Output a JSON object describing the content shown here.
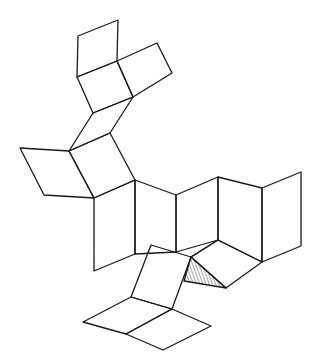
{
  "diagram": {
    "type": "polyhedron-net",
    "stroke_color": "#1a1a1a",
    "background": "#ffffff",
    "faces": [
      {
        "id": "top-left-square",
        "points": "78,36 118,20 117,61 77,77"
      },
      {
        "id": "top-center-square",
        "points": "77,77 117,61 133,97 93,113"
      },
      {
        "id": "top-right-square",
        "points": "117,61 157,43 172,73 133,97"
      },
      {
        "id": "upper-rhombus",
        "points": "93,113 133,97 110,133 69,151"
      },
      {
        "id": "left-wing-square",
        "points": "69,151 20,148 44,195 94,198"
      },
      {
        "id": "middle-square",
        "points": "69,151 110,133 135,180 94,198"
      },
      {
        "id": "strip-panel-1",
        "points": "94,198 135,180 135,254 94,271"
      },
      {
        "id": "strip-panel-2",
        "points": "135,180 176,195 176,252 135,254"
      },
      {
        "id": "strip-panel-3",
        "points": "176,195 218,177 218,240 176,252"
      },
      {
        "id": "strip-panel-4",
        "points": "218,177 262,188 262,262 218,240"
      },
      {
        "id": "strip-panel-5",
        "points": "262,188 301,172 301,246 262,262"
      },
      {
        "id": "lower-right-quad",
        "points": "191,257 218,240 262,262 226,288"
      },
      {
        "id": "tilted-square",
        "points": "151,245 191,257 172,309 131,297"
      },
      {
        "id": "bottom-left-rhombus",
        "points": "131,297 172,309 126,334 83,322"
      },
      {
        "id": "bottom-right-rhombus",
        "points": "172,309 211,326 163,350 126,334"
      }
    ],
    "hatched_face": {
      "id": "hatched-triangle",
      "points": "191,257 184,281 226,288"
    },
    "extra_edges": [
      {
        "id": "fold-line-1",
        "points": "191,257 218,240"
      }
    ]
  }
}
